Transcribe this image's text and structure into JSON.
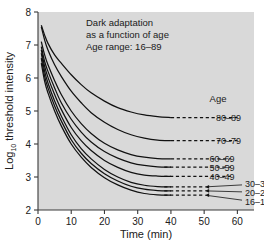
{
  "figure": {
    "background_color": "#ffffff",
    "plot_background_color": "#d9d9d9",
    "line_color": "#111111"
  },
  "annotations": {
    "title_line1": "Dark adaptation",
    "title_line2": "as a function of age",
    "title_line3": "Age range: 16–89",
    "legend_header": "Age"
  },
  "chart_data": {
    "type": "line",
    "title": "Dark adaptation as a function of age",
    "subtitle": "Age range: 16–89",
    "xlabel": "Time (min)",
    "ylabel": "Log10 threshold intensity",
    "ylabel_base": "Log",
    "ylabel_sub": "10",
    "ylabel_rest": " threshold intensity",
    "xlim": [
      0,
      65
    ],
    "ylim": [
      2,
      8
    ],
    "xticks": [
      0,
      10,
      20,
      30,
      40,
      50,
      60
    ],
    "yticks": [
      2,
      3,
      4,
      5,
      6,
      7,
      8
    ],
    "xtick_labels": [
      "0",
      "10",
      "20",
      "30",
      "40",
      "50",
      "60"
    ],
    "ytick_labels": [
      "2",
      "3",
      "4",
      "5",
      "6",
      "7",
      "8"
    ],
    "grid": false,
    "legend_position": "right-inline-labels",
    "series": [
      {
        "name": "80–89",
        "label": "80–89",
        "plateau": 4.8,
        "start": 7.6,
        "x": [
          1,
          2,
          3,
          5,
          7,
          10,
          13,
          16,
          20,
          24,
          28,
          32,
          36,
          40
        ],
        "y": [
          7.6,
          7.3,
          7.05,
          6.7,
          6.45,
          6.1,
          5.8,
          5.55,
          5.3,
          5.1,
          4.97,
          4.88,
          4.83,
          4.8
        ],
        "dash_from": 40,
        "dash_to": 60,
        "label_x": 62
      },
      {
        "name": "70–79",
        "label": "70–79",
        "plateau": 4.1,
        "start": 7.55,
        "x": [
          1,
          2,
          3,
          5,
          7,
          10,
          13,
          16,
          20,
          24,
          28,
          32,
          36,
          40
        ],
        "y": [
          7.55,
          7.15,
          6.85,
          6.4,
          6.05,
          5.6,
          5.25,
          4.95,
          4.66,
          4.44,
          4.28,
          4.18,
          4.12,
          4.1
        ],
        "dash_from": 40,
        "dash_to": 60,
        "label_x": 62
      },
      {
        "name": "60–69",
        "label": "60–69",
        "plateau": 3.55,
        "start": 7.1,
        "x": [
          1,
          2,
          3,
          5,
          7,
          10,
          13,
          16,
          20,
          24,
          28,
          32,
          36,
          40
        ],
        "y": [
          7.1,
          6.7,
          6.4,
          5.92,
          5.5,
          5.0,
          4.62,
          4.32,
          4.02,
          3.82,
          3.68,
          3.6,
          3.56,
          3.55
        ],
        "dash_from": 40,
        "dash_to": 58,
        "label_x": 60
      },
      {
        "name": "50–59",
        "label": "50–59",
        "plateau": 3.3,
        "start": 6.95,
        "x": [
          1,
          2,
          3,
          5,
          7,
          10,
          13,
          16,
          20,
          24,
          28,
          32,
          36,
          40
        ],
        "y": [
          6.95,
          6.5,
          6.2,
          5.7,
          5.25,
          4.75,
          4.36,
          4.06,
          3.77,
          3.57,
          3.43,
          3.35,
          3.31,
          3.3
        ],
        "dash_from": 38,
        "dash_to": 58,
        "label_x": 60
      },
      {
        "name": "40–49",
        "label": "40–49",
        "plateau": 3.02,
        "start": 6.85,
        "x": [
          1,
          2,
          3,
          5,
          7,
          10,
          13,
          16,
          20,
          24,
          28,
          32,
          36,
          40
        ],
        "y": [
          6.85,
          6.35,
          6.02,
          5.5,
          5.05,
          4.5,
          4.1,
          3.8,
          3.5,
          3.29,
          3.14,
          3.06,
          3.03,
          3.02
        ],
        "dash_from": 38,
        "dash_to": 58,
        "label_x": 60
      },
      {
        "name": "30–39",
        "label": "30–39",
        "plateau": 2.7,
        "start": 6.75,
        "x": [
          1,
          2,
          3,
          5,
          7,
          10,
          13,
          16,
          20,
          24,
          28,
          32,
          36,
          40
        ],
        "y": [
          6.75,
          6.2,
          5.85,
          5.3,
          4.85,
          4.28,
          3.86,
          3.55,
          3.23,
          3.0,
          2.84,
          2.75,
          2.71,
          2.7
        ],
        "dash_from": 38,
        "dash_to": 50,
        "label_x": 62,
        "leader": true
      },
      {
        "name": "20–29",
        "label": "20–29",
        "plateau": 2.58,
        "start": 6.6,
        "x": [
          1,
          2,
          3,
          5,
          7,
          10,
          13,
          16,
          20,
          24,
          28,
          32,
          36,
          40
        ],
        "y": [
          6.6,
          6.05,
          5.7,
          5.15,
          4.7,
          4.13,
          3.72,
          3.41,
          3.1,
          2.88,
          2.72,
          2.63,
          2.59,
          2.58
        ],
        "dash_from": 38,
        "dash_to": 50,
        "label_x": 62,
        "leader": true
      },
      {
        "name": "16–19",
        "label": "16–19",
        "plateau": 2.45,
        "start": 6.45,
        "x": [
          1,
          2,
          3,
          5,
          7,
          10,
          13,
          16,
          20,
          24,
          28,
          32,
          36,
          40
        ],
        "y": [
          6.45,
          5.9,
          5.55,
          5.0,
          4.55,
          4.0,
          3.6,
          3.29,
          2.98,
          2.76,
          2.6,
          2.5,
          2.46,
          2.45
        ],
        "dash_from": 38,
        "dash_to": 50,
        "label_x": 62,
        "leader": true
      }
    ]
  }
}
